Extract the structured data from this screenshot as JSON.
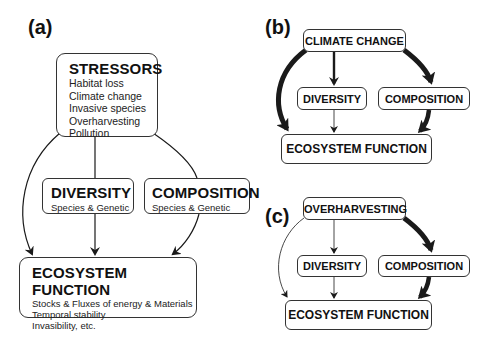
{
  "panels": {
    "a": {
      "label": "(a)",
      "stressors": {
        "title": "STRESSORS",
        "items": [
          "Habitat loss",
          "Climate change",
          "Invasive species",
          "Overharvesting",
          "Pollution"
        ]
      },
      "diversity": {
        "title": "DIVERSITY",
        "subtitle": "Species & Genetic"
      },
      "composition": {
        "title": "COMPOSITION",
        "subtitle": "Species & Genetic"
      },
      "ecosystem_function": {
        "title": "ECOSYSTEM FUNCTION",
        "items": [
          "Stocks & Fluxes of energy & Materials",
          "Temporal stability",
          "Invasibility, etc."
        ]
      }
    },
    "b": {
      "label": "(b)",
      "driver": "CLIMATE CHANGE",
      "diversity": "DIVERSITY",
      "composition": "COMPOSITION",
      "ecosystem_function": "ECOSYSTEM FUNCTION",
      "arrow_weights": {
        "driver_to_ecosystem": "thick",
        "driver_to_diversity": "medium",
        "driver_to_composition": "thick",
        "diversity_to_ecosystem": "thin",
        "composition_to_ecosystem": "thick"
      }
    },
    "c": {
      "label": "(c)",
      "driver": "OVERHARVESTING",
      "diversity": "DIVERSITY",
      "composition": "COMPOSITION",
      "ecosystem_function": "ECOSYSTEM FUNCTION",
      "arrow_weights": {
        "driver_to_ecosystem": "thin",
        "driver_to_diversity": "thin",
        "driver_to_composition": "thick",
        "diversity_to_ecosystem": "thin",
        "composition_to_ecosystem": "thick"
      }
    }
  },
  "colors": {
    "line": "#1a1a1a",
    "box_border": "#333333",
    "background": "#ffffff"
  }
}
